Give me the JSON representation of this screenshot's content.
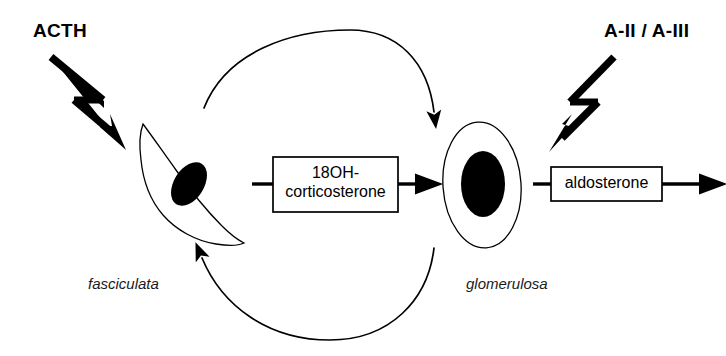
{
  "figure": {
    "background_color": "#ffffff",
    "stroke_color": "#000000",
    "width": 726,
    "height": 356
  },
  "stimuli": [
    {
      "id": "acth",
      "label": "ACTH",
      "icon": "lightning-bolt-arrow-icon",
      "direction": "down-right",
      "targets": "fasciculata"
    },
    {
      "id": "angiotensin",
      "label": "A-II / A-III",
      "icon": "lightning-bolt-arrow-icon",
      "direction": "down-left",
      "targets": "glomerulosa"
    }
  ],
  "cells": [
    {
      "id": "fasciculata",
      "label": "fasciculata",
      "shape": "spindle",
      "nucleus": "filled-ellipse",
      "nucleus_color": "#000000"
    },
    {
      "id": "glomerulosa",
      "label": "glomerulosa",
      "shape": "oval",
      "nucleus": "filled-ellipse",
      "nucleus_color": "#000000"
    }
  ],
  "boxes": [
    {
      "id": "box-18oh",
      "line1": "18OH-",
      "line2": "corticosterone",
      "has_input_arrow": true,
      "has_output_arrow": true
    },
    {
      "id": "box-aldosterone",
      "line1": "aldosterone",
      "line2": "",
      "has_input_arrow": true,
      "has_output_arrow": true
    }
  ],
  "flow_arrows": [
    {
      "id": "top-arc",
      "from": "fasciculata",
      "to": "glomerulosa",
      "style": "curved-arc",
      "position": "top"
    },
    {
      "id": "bottom-arc",
      "from": "glomerulosa",
      "to": "fasciculata",
      "style": "curved-arc",
      "position": "bottom"
    }
  ]
}
